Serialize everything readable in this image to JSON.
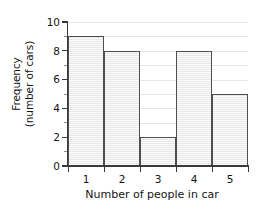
{
  "chart_data": {
    "type": "bar",
    "title": "",
    "subtitle": "",
    "categories": [
      "1",
      "2",
      "3",
      "4",
      "5"
    ],
    "values": [
      9,
      8,
      2,
      8,
      5
    ],
    "xlabel": "Number of people in car",
    "ylabel": "Frequency (number of cars)",
    "ylabel_line1": "Frequency",
    "ylabel_line2": "(number of cars)",
    "ylim": [
      0,
      10
    ],
    "xlim": [
      0.5,
      5.5
    ],
    "y_tick_labels": [
      "0",
      "2",
      "4",
      "6",
      "8",
      "10"
    ],
    "y_tick_values": [
      0,
      2,
      4,
      6,
      8,
      10
    ],
    "y_minor_tick_values": [
      1,
      3,
      5,
      7,
      9
    ],
    "gridline_values": [
      1,
      2,
      3,
      4,
      5,
      6,
      7,
      8,
      9,
      10
    ],
    "grid": true,
    "grid_axis": "y",
    "legend": null,
    "legend_position": "none",
    "bars_contiguous": true,
    "colors": {
      "bar_fill": "#ededed",
      "bar_edge": "#4e4e4e",
      "gridline": "#e6e6e6",
      "axis": "#3a3a3a",
      "text": "#141414",
      "background": "#ffffff"
    }
  }
}
